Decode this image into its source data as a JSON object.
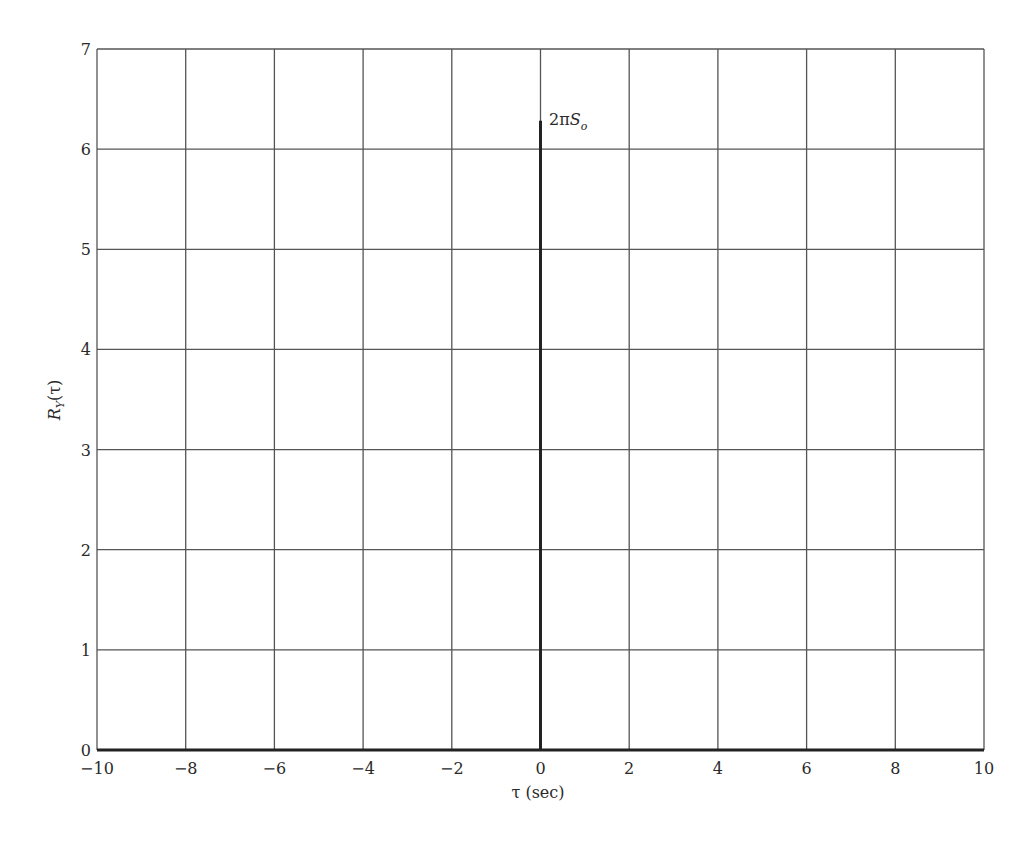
{
  "chart_data": {
    "type": "line",
    "title": "",
    "xlabel": "τ (sec)",
    "ylabel": "R_Y(τ)",
    "ylabel_main": "R",
    "ylabel_sub": "Y",
    "ylabel_arg": "(τ)",
    "xlim": [
      -10,
      10
    ],
    "ylim": [
      0,
      7
    ],
    "grid": true,
    "legend": null,
    "x_ticks": [
      -10,
      -8,
      -6,
      -4,
      -2,
      0,
      2,
      4,
      6,
      8,
      10
    ],
    "x_tick_labels": [
      "−10",
      "−8",
      "−6",
      "−4",
      "−2",
      "0",
      "2",
      "4",
      "6",
      "8",
      "10"
    ],
    "y_ticks": [
      0,
      1,
      2,
      3,
      4,
      5,
      6,
      7
    ],
    "y_tick_labels": [
      "0",
      "1",
      "2",
      "3",
      "4",
      "5",
      "6",
      "7"
    ],
    "series": [
      {
        "name": "R_Y(τ) impulse",
        "kind": "impulse",
        "x": [
          0
        ],
        "y": [
          6.283
        ],
        "annotation": "2πS_o"
      }
    ],
    "annotations": [
      {
        "text_main": "2π",
        "text_italic": "S",
        "text_sub": "o",
        "x": 0,
        "y": 6.28
      }
    ],
    "colors": {
      "grid": "#555555",
      "axis": "#222222",
      "impulse": "#222222",
      "text": "#2a2a2a"
    }
  }
}
